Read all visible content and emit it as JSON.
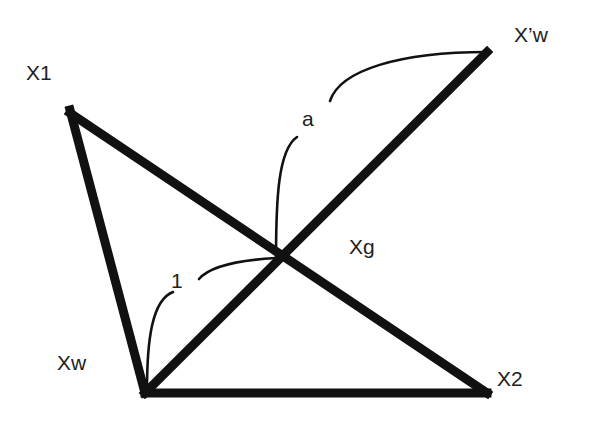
{
  "diagram": {
    "type": "geometric-figure",
    "stroke_color": "#111111",
    "background": "#ffffff",
    "points": {
      "X1": {
        "label": "X1",
        "x": 70,
        "y": 110
      },
      "Xpw": {
        "label": "X’w",
        "x": 487,
        "y": 52
      },
      "Xw": {
        "label": "Xw",
        "x": 145,
        "y": 393
      },
      "X2": {
        "label": "X2",
        "x": 487,
        "y": 393
      },
      "Xg": {
        "label": "Xg",
        "x": 280,
        "y": 260
      }
    },
    "segments": [
      {
        "from": "X1",
        "to": "Xw"
      },
      {
        "from": "X1",
        "to": "X2"
      },
      {
        "from": "Xw",
        "to": "X2"
      },
      {
        "from": "Xw",
        "to": "Xpw"
      }
    ],
    "annotations": {
      "a": {
        "label": "a",
        "meaning": "length from Xg to X'w"
      },
      "one": {
        "label": "1",
        "meaning": "length from Xw to Xg"
      }
    }
  }
}
